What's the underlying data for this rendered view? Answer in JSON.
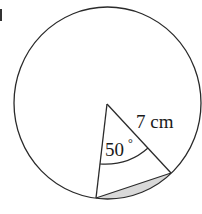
{
  "diagram": {
    "type": "circle-sector-segment",
    "radius_label": "7 cm",
    "angle_label": "50",
    "degree_symbol": "°",
    "shaded_region": "minor segment between chord and arc",
    "colors": {
      "stroke": "#2a2a2a",
      "shade": "#d9d9d9",
      "background": "#ffffff"
    }
  }
}
